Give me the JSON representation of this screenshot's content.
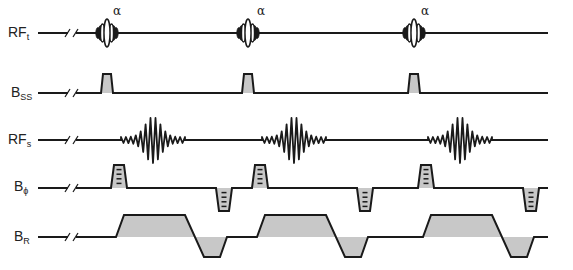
{
  "diagram": {
    "type": "MRI pulse sequence timing diagram",
    "repetitions": 3,
    "rows": [
      {
        "id": "rf_t",
        "label_main": "RF",
        "label_sub": "t",
        "baseline_y": 33,
        "description": "RF transmit pulses with flip angle"
      },
      {
        "id": "b_ss",
        "label_main": "B",
        "label_sub": "SS",
        "baseline_y": 93,
        "description": "Slice-select gradient"
      },
      {
        "id": "rf_s",
        "label_main": "RF",
        "label_sub": "s",
        "baseline_y": 140,
        "description": "Received signal (echo)"
      },
      {
        "id": "b_phi",
        "label_main": "B",
        "label_sub": "ϕ",
        "baseline_y": 188,
        "description": "Phase-encoding gradient (stepped)"
      },
      {
        "id": "b_r",
        "label_main": "B",
        "label_sub": "R",
        "baseline_y": 237,
        "description": "Readout gradient"
      }
    ],
    "pulse_annotation": "α",
    "pulse_centers_x": [
      107,
      248,
      414
    ],
    "line_start_x": 38,
    "line_end_x": 548,
    "break_mark_x": [
      66,
      74
    ],
    "colors": {
      "line": "#1a1a1a",
      "fill": "#c8c8c8",
      "background": "#ffffff"
    }
  }
}
